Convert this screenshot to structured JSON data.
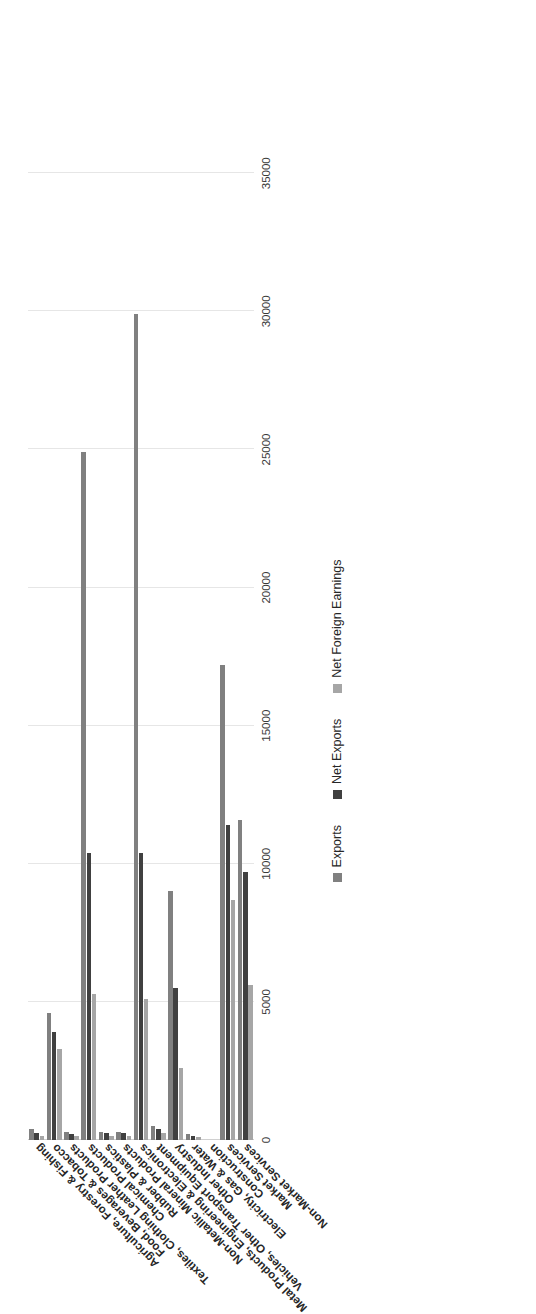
{
  "chart_data": {
    "type": "bar",
    "orientation": "horizontal-rotated",
    "title": "",
    "subtitle": "",
    "xlabel": "",
    "ylabel": "",
    "xlim": [
      0,
      37000
    ],
    "grid": true,
    "legend_position": "bottom",
    "tick_labels": [
      "0",
      "5000",
      "10000",
      "15000",
      "20000",
      "25000",
      "30000",
      "35000"
    ],
    "tick_values": [
      0,
      5000,
      10000,
      15000,
      20000,
      25000,
      30000,
      35000
    ],
    "categories": [
      "Agriculture, Forestry & Fishing",
      "Food, Beverages & Tobacco",
      "Textiles, Clothing Leather Products",
      "Chemical Products",
      "Rubber & Plastics",
      "Non-Metallic Mineral Products",
      "Metal Products, Engineering & Electronics",
      "Vehicles, Other Transport Equipment",
      "Other Industry",
      "Electricity, Gas & Water",
      "Construction",
      "Market Services",
      "Non-Market Services"
    ],
    "series": [
      {
        "name": "Exports",
        "color": "#808080",
        "values": [
          400,
          4600,
          300,
          24900,
          300,
          300,
          29900,
          500,
          9000,
          200,
          0,
          17200,
          11600
        ]
      },
      {
        "name": "Net Exports",
        "color": "#404040",
        "values": [
          250,
          3900,
          200,
          10400,
          250,
          250,
          10400,
          400,
          5500,
          150,
          0,
          11400,
          9700
        ]
      },
      {
        "name": "Net Foreign Earnings",
        "color": "#a6a6a6",
        "values": [
          150,
          3300,
          150,
          5300,
          150,
          150,
          5100,
          250,
          2600,
          100,
          0,
          8700,
          5600
        ]
      }
    ]
  },
  "legend": {
    "items": [
      {
        "label": "Exports",
        "color": "#808080"
      },
      {
        "label": "Net Exports",
        "color": "#404040"
      },
      {
        "label": "Net Foreign Earnings",
        "color": "#a6a6a6"
      }
    ]
  }
}
